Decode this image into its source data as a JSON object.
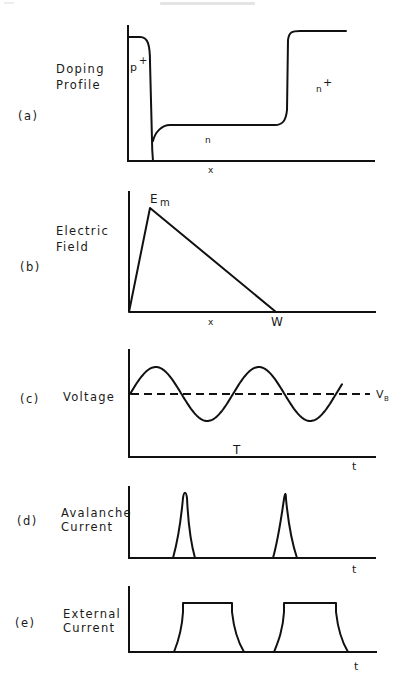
{
  "header": {
    "text": ""
  },
  "panels": [
    {
      "id": "a",
      "tag": "(a)",
      "label_lines": [
        "Doping",
        "Profile"
      ],
      "x_axis_label": "x",
      "annotations": [
        "p",
        "+",
        "n",
        "n",
        "+"
      ]
    },
    {
      "id": "b",
      "tag": "(b)",
      "label_lines": [
        "Electric",
        "Field"
      ],
      "x_axis_label": "x",
      "annotations": [
        "E",
        "m",
        "W"
      ]
    },
    {
      "id": "c",
      "tag": "(c)",
      "label_lines": [
        "Voltage"
      ],
      "x_axis_label": "t",
      "annotations": [
        "V",
        "B",
        "T"
      ]
    },
    {
      "id": "d",
      "tag": "(d)",
      "label_lines": [
        "Avalanche",
        "Current"
      ],
      "x_axis_label": "t",
      "annotations": []
    },
    {
      "id": "e",
      "tag": "(e)",
      "label_lines": [
        "External",
        "Current"
      ],
      "x_axis_label": "t",
      "annotations": []
    }
  ],
  "chart_data": [
    {
      "type": "line",
      "title": "Doping Profile",
      "xlabel": "x",
      "ylabel": "Doping Profile",
      "regions": [
        "p+",
        "n",
        "n+"
      ],
      "series": [
        {
          "name": "doping",
          "shape": "p+ high near x=0, abrupt drop to low n plateau, step up to n+ plateau"
        }
      ]
    },
    {
      "type": "line",
      "title": "Electric Field",
      "xlabel": "x",
      "ylabel": "Electric Field",
      "series": [
        {
          "name": "field",
          "points": [
            [
              0,
              0
            ],
            [
              0.15,
              1.0
            ],
            [
              1.0,
              0
            ]
          ]
        }
      ],
      "annotations": [
        "Em (peak field)",
        "W (depletion width)"
      ]
    },
    {
      "type": "line",
      "title": "Voltage",
      "xlabel": "t",
      "ylabel": "Voltage",
      "series": [
        {
          "name": "voltage",
          "shape": "sinusoid about VB, ~2 periods"
        },
        {
          "name": "VB",
          "style": "dashed",
          "shape": "constant breakdown voltage"
        }
      ],
      "annotations": [
        "VB",
        "T"
      ]
    },
    {
      "type": "line",
      "title": "Avalanche Current",
      "xlabel": "t",
      "ylabel": "Avalanche Current",
      "series": [
        {
          "name": "avalanche current",
          "shape": "two sharp spikes, one per period"
        }
      ]
    },
    {
      "type": "line",
      "title": "External Current",
      "xlabel": "t",
      "ylabel": "External Current",
      "series": [
        {
          "name": "external current",
          "shape": "two flat-topped pulses, one per period"
        }
      ]
    }
  ]
}
